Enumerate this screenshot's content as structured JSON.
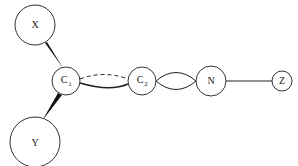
{
  "diagram": {
    "type": "graph",
    "nodes": [
      {
        "id": "X",
        "label": "X",
        "sub": "",
        "cx": 35,
        "cy": 25,
        "r": 20
      },
      {
        "id": "C1",
        "label": "C",
        "sub": "1",
        "cx": 66,
        "cy": 81,
        "r": 14
      },
      {
        "id": "Y",
        "label": "Y",
        "sub": "",
        "cx": 35,
        "cy": 142,
        "r": 25
      },
      {
        "id": "C2",
        "label": "C",
        "sub": "2",
        "cx": 142,
        "cy": 81,
        "r": 14
      },
      {
        "id": "N",
        "label": "N",
        "sub": "",
        "cx": 211,
        "cy": 81,
        "r": 15
      },
      {
        "id": "Z",
        "label": "Z",
        "sub": "",
        "cx": 282,
        "cy": 81,
        "r": 10
      }
    ],
    "edges": [
      {
        "from": "X",
        "to": "C1",
        "style": "wedge"
      },
      {
        "from": "Y",
        "to": "C1",
        "style": "wedge"
      },
      {
        "from": "C1",
        "to": "C2",
        "style": "solid-curve-bold"
      },
      {
        "from": "C1",
        "to": "C2",
        "style": "dashed-curve"
      },
      {
        "from": "C2",
        "to": "N",
        "style": "double-arc"
      },
      {
        "from": "N",
        "to": "Z",
        "style": "solid"
      }
    ]
  }
}
